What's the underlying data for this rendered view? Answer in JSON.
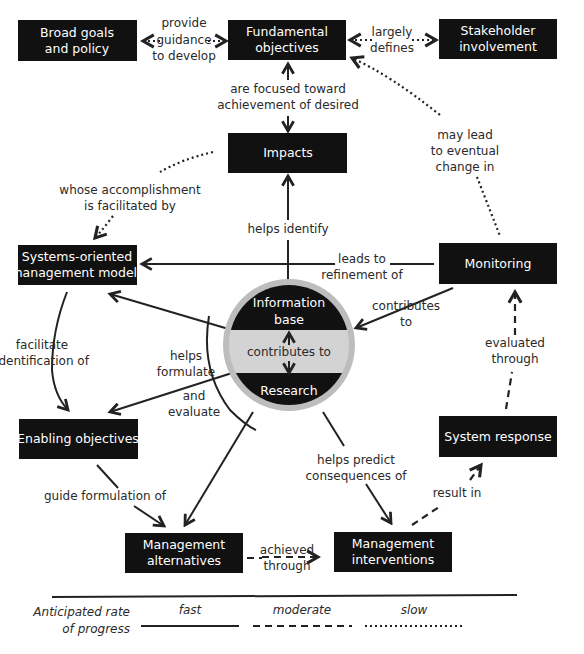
{
  "nodes": {
    "broad_goals": {
      "line1": "Broad goals",
      "line2": "and policy"
    },
    "fundamental": {
      "line1": "Fundamental",
      "line2": "objectives"
    },
    "stakeholder": {
      "line1": "Stakeholder",
      "line2": "involvement"
    },
    "impacts": {
      "line1": "Impacts"
    },
    "systems_models": {
      "line1": "Systems-oriented",
      "line2": "management models"
    },
    "monitoring": {
      "line1": "Monitoring"
    },
    "info_base": {
      "line1": "Information",
      "line2": "base"
    },
    "research": {
      "line1": "Research"
    },
    "enabling": {
      "line1": "Enabling objectives"
    },
    "system_response": {
      "line1": "System response"
    },
    "mgmt_alternatives": {
      "line1": "Management",
      "line2": "alternatives"
    },
    "mgmt_interventions": {
      "line1": "Management",
      "line2": "interventions"
    }
  },
  "edges": {
    "provide_guidance": {
      "line1": "provide",
      "line2": "guidance",
      "line3": "to develop",
      "style": "dotted"
    },
    "largely_defines": {
      "line1": "largely",
      "line2": "defines",
      "style": "dotted"
    },
    "focused_toward": {
      "line1": "are focused toward",
      "line2": "achievement of desired",
      "style": "solid"
    },
    "whose_accomplishment": {
      "line1": "whose accomplishment",
      "line2": "is facilitated by",
      "style": "dotted"
    },
    "may_lead": {
      "line1": "may lead",
      "line2": "to eventual",
      "line3": "change in",
      "style": "dotted"
    },
    "helps_identify": {
      "line1": "helps identify",
      "style": "solid"
    },
    "leads_to_refinement": {
      "line1": "leads to",
      "line2": "refinement of",
      "style": "solid"
    },
    "contributes_to_right": {
      "line1": "contributes",
      "line2": "to",
      "style": "solid"
    },
    "contributes_to_center": {
      "line1": "contributes to",
      "style": "solid"
    },
    "facilitate_identification": {
      "line1": "facilitate",
      "line2": "identification of",
      "style": "solid"
    },
    "helps_formulate": {
      "line1": "helps",
      "line2": "formulate",
      "style": "solid"
    },
    "and_evaluate": {
      "line1": "and",
      "line2": "evaluate",
      "style": "solid"
    },
    "evaluated_through": {
      "line1": "evaluated",
      "line2": "through",
      "style": "dashed"
    },
    "helps_predict": {
      "line1": "helps  predict",
      "line2": "consequences of",
      "style": "solid"
    },
    "guide_formulation": {
      "line1": "guide formulation of",
      "style": "solid"
    },
    "result_in": {
      "line1": "result in",
      "style": "dashed"
    },
    "achieved_through": {
      "line1": "achieved",
      "line2": "through",
      "style": "dashed"
    }
  },
  "legend": {
    "title_line1": "Anticipated rate",
    "title_line2": "of progress",
    "fast": "fast",
    "moderate": "moderate",
    "slow": "slow"
  },
  "colors": {
    "box_fill": "#111111",
    "box_text": "#ffffff",
    "line": "#222222",
    "center_band": "#d0d0d0",
    "center_ring": "#bdbdbd"
  }
}
